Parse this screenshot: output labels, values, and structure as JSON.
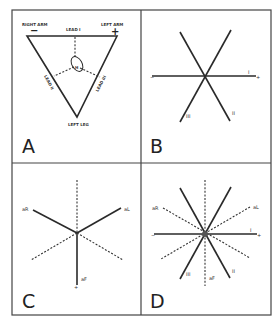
{
  "figure": {
    "panels": [
      {
        "letter": "A",
        "labels": {
          "right_arm": "RIGHT ARM",
          "left_arm": "LEFT ARM",
          "left_leg": "LEFT LEG",
          "lead_1": "LEAD I",
          "lead_2": "LEAD II",
          "lead_3": "LEAD III",
          "minus": "−",
          "plus": "+",
          "heart_marker": "H"
        }
      },
      {
        "letter": "B",
        "labels": {
          "minus": "−",
          "plus": "+",
          "lead_1": "I",
          "lead_2": "II",
          "lead_3": "III"
        }
      },
      {
        "letter": "C",
        "labels": {
          "avr": "aR",
          "avl": "aL",
          "avf": "aF",
          "plus": "+"
        }
      },
      {
        "letter": "D",
        "labels": {
          "avr": "aR",
          "avl": "aL",
          "avf": "aF",
          "lead_1": "I",
          "lead_2": "II",
          "lead_3": "III",
          "minus": "−",
          "plus": "+"
        }
      }
    ]
  },
  "colors": {
    "line": "#2a2a2a",
    "frame": "#444444",
    "background": "#ffffff"
  }
}
